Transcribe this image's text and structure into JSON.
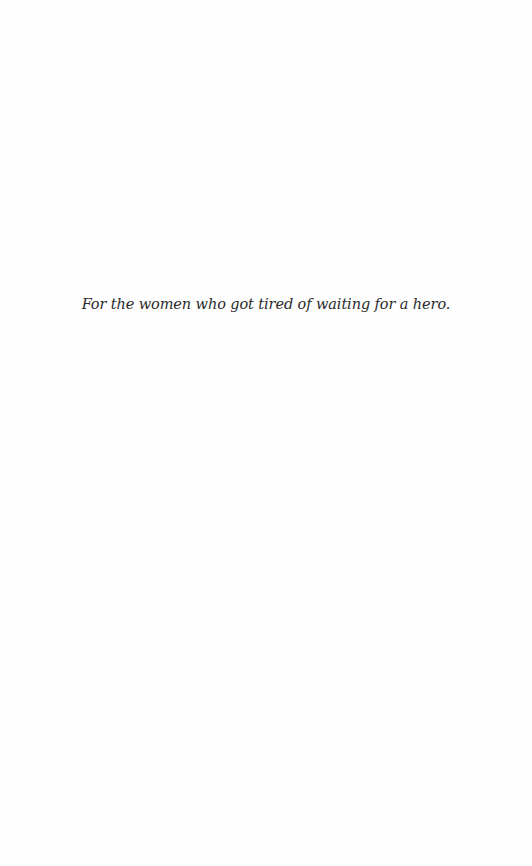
{
  "page": {
    "type": "dedication",
    "background_color": "#fefefe",
    "text_color": "#2b2b2b"
  },
  "dedication": {
    "text": "For the women who got tired of waiting for a hero."
  }
}
